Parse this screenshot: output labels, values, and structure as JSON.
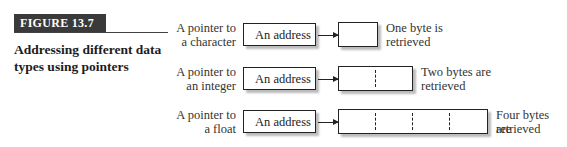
{
  "figure": {
    "label": "FIGURE 13.7",
    "title": "Addressing different data types using pointers"
  },
  "rows": [
    {
      "pointer_label_line1": "A pointer to",
      "pointer_label_line2": "a character",
      "address_box": "An address",
      "bytes": 1,
      "result_line1": "One byte is",
      "result_line2": "retrieved"
    },
    {
      "pointer_label_line1": "A pointer to",
      "pointer_label_line2": "an integer",
      "address_box": "An address",
      "bytes": 2,
      "result_line1": "Two bytes are",
      "result_line2": "retrieved"
    },
    {
      "pointer_label_line1": "A pointer to",
      "pointer_label_line2": "a float",
      "address_box": "An address",
      "bytes": 4,
      "result_line1": "Four bytes are",
      "result_line2": "retrieved"
    }
  ]
}
